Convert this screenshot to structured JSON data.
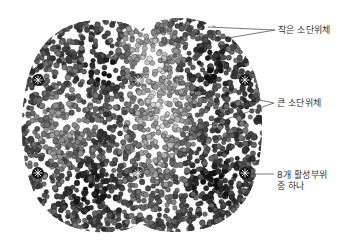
{
  "figure": {
    "labels": {
      "small_subunit": "작은 소단위체",
      "large_subunit": "큰 소단위체",
      "active_site_line1": "8개 활성부위",
      "active_site_line2": "중 하나"
    },
    "active_site_markers": [
      {
        "x": 38,
        "y": 80
      },
      {
        "x": 138,
        "y": 80
      },
      {
        "x": 245,
        "y": 80
      },
      {
        "x": 38,
        "y": 173
      },
      {
        "x": 138,
        "y": 173
      },
      {
        "x": 245,
        "y": 173
      }
    ],
    "colors": {
      "background": "#ffffff",
      "molecule_dark": "#1a1a1a",
      "molecule_mid": "#6b6b6b",
      "molecule_light": "#d8d8d8",
      "leader_line": "#555555",
      "label_text": "#333333"
    }
  }
}
